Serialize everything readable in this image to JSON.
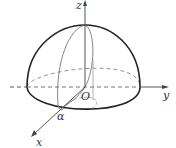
{
  "diagram": {
    "labels": {
      "z_axis": "z",
      "y_axis": "y",
      "x_axis": "x",
      "origin": "O",
      "angle": "α"
    },
    "colors": {
      "outline": "#222222",
      "inner": "#777777",
      "dashed": "#888888",
      "axis": "#444444"
    }
  }
}
